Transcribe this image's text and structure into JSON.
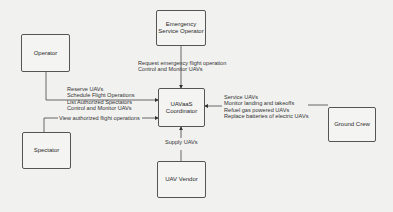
{
  "diagram": {
    "nodes": {
      "operator": {
        "label": "Operator"
      },
      "emergency": {
        "label": "Emergency Service Operator"
      },
      "coordinator": {
        "label": "UAVaaS Coordinator"
      },
      "ground_crew": {
        "label": "Ground Crew"
      },
      "spectator": {
        "label": "Spectator"
      },
      "vendor": {
        "label": "UAV Vendor"
      }
    },
    "edges": {
      "operator": {
        "lines": [
          "Reserve UAVs",
          "Schedule Flight Operations",
          "List Authorized Spectators",
          "Control and Monitor UAVs"
        ]
      },
      "emergency": {
        "lines": [
          "Request emergency flight operation",
          "Control and Monitor UAVs"
        ]
      },
      "spectator": {
        "lines": [
          "View authorized flight operations"
        ]
      },
      "vendor": {
        "lines": [
          "Supply UAVs"
        ]
      },
      "ground_crew": {
        "lines": [
          "Service UAVs",
          "Monitor landing and takeoffs",
          "Refuel gas powered UAVs",
          "Replace batteries of electric UAVs"
        ]
      }
    }
  }
}
